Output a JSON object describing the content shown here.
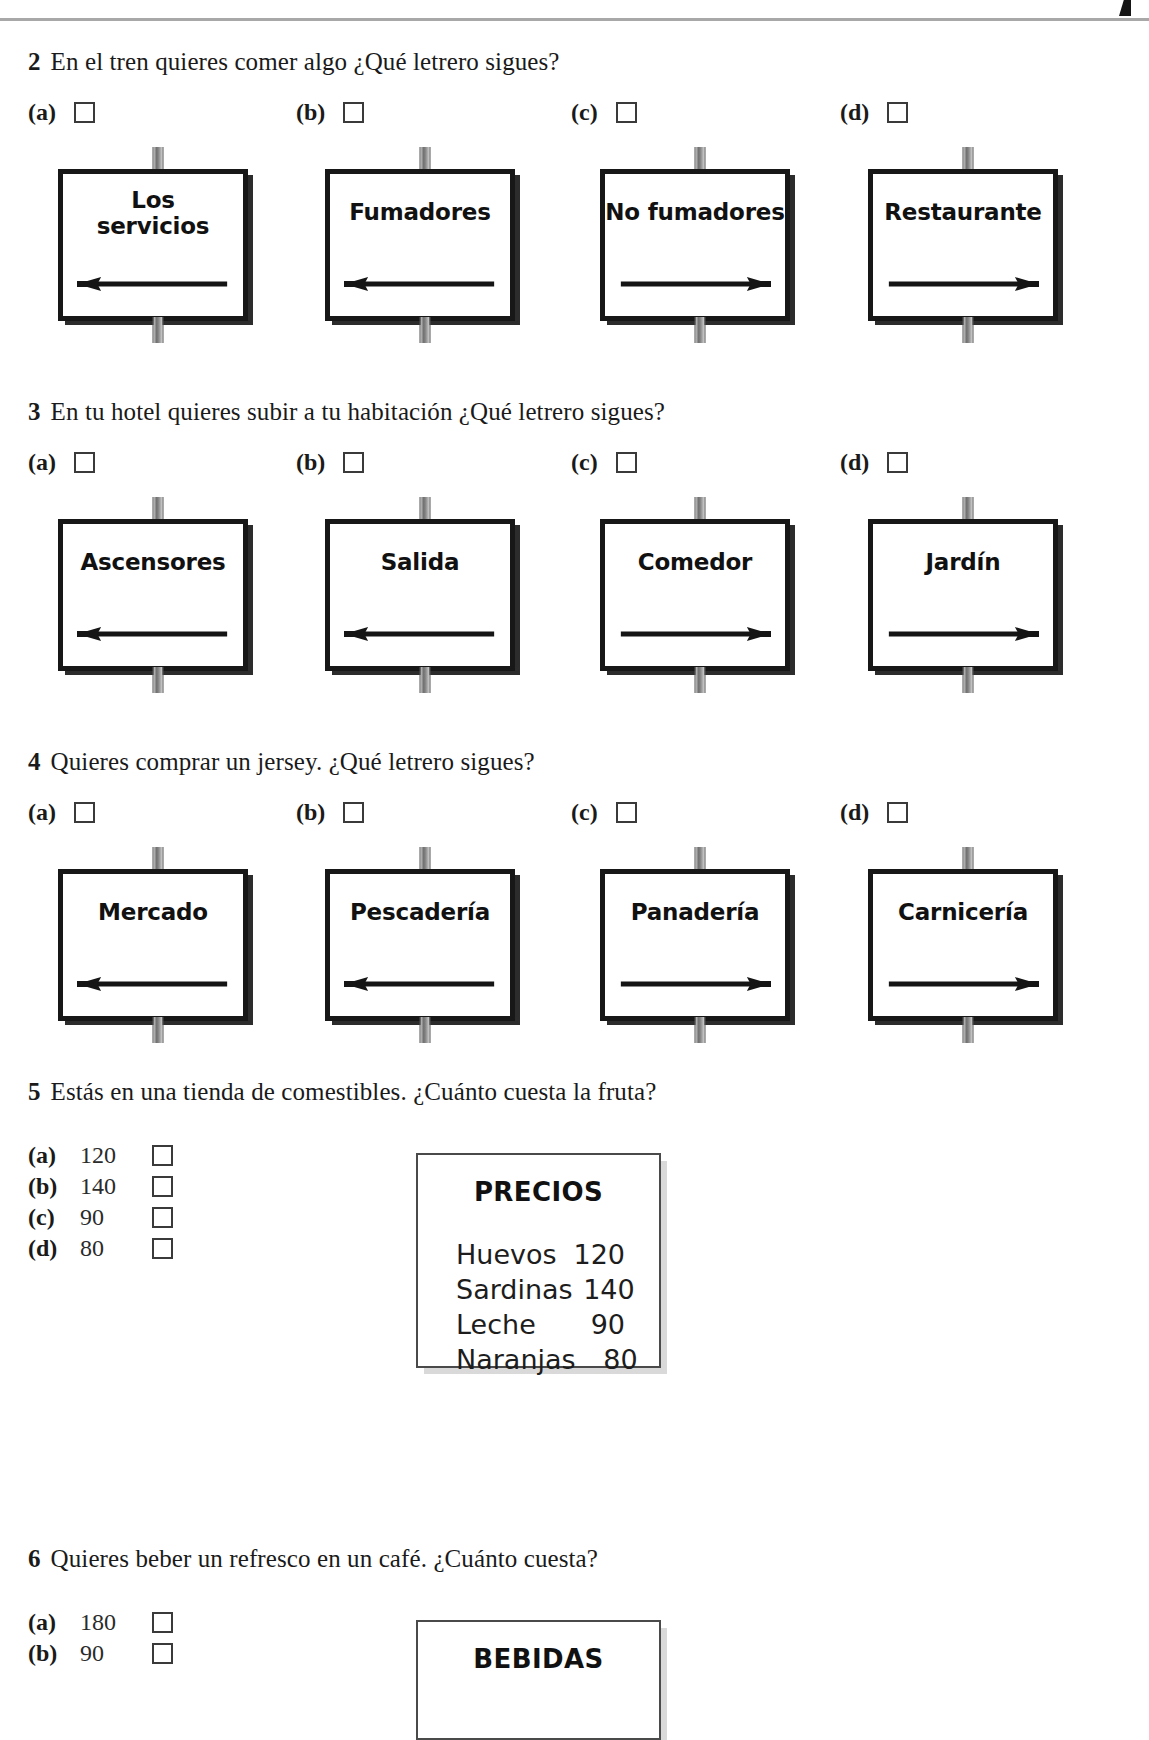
{
  "page": {
    "rule_color": "#a8a8a8"
  },
  "questions": [
    {
      "number": "2",
      "text": "En el tren quieres comer algo ¿Qué letrero sigues?",
      "options": [
        {
          "letter": "(a)",
          "sign": "Los servicios",
          "arrow": "left"
        },
        {
          "letter": "(b)",
          "sign": "Fumadores",
          "arrow": "left"
        },
        {
          "letter": "(c)",
          "sign": "No fumadores",
          "arrow": "right"
        },
        {
          "letter": "(d)",
          "sign": "Restaurante",
          "arrow": "right"
        }
      ]
    },
    {
      "number": "3",
      "text": "En tu hotel quieres subir a tu habitación ¿Qué letrero sigues?",
      "options": [
        {
          "letter": "(a)",
          "sign": "Ascensores",
          "arrow": "left"
        },
        {
          "letter": "(b)",
          "sign": "Salida",
          "arrow": "left"
        },
        {
          "letter": "(c)",
          "sign": "Comedor",
          "arrow": "right"
        },
        {
          "letter": "(d)",
          "sign": "Jardín",
          "arrow": "right"
        }
      ]
    },
    {
      "number": "4",
      "text": "Quieres comprar un jersey. ¿Qué letrero sigues?",
      "options": [
        {
          "letter": "(a)",
          "sign": "Mercado",
          "arrow": "left"
        },
        {
          "letter": "(b)",
          "sign": "Pescadería",
          "arrow": "left"
        },
        {
          "letter": "(c)",
          "sign": "Panadería",
          "arrow": "right"
        },
        {
          "letter": "(d)",
          "sign": "Carnicería",
          "arrow": "right"
        }
      ]
    },
    {
      "number": "5",
      "text": "Estás en una tienda de comestibles. ¿Cuánto cuesta la fruta?",
      "options": [
        {
          "letter": "(a)",
          "value": "120"
        },
        {
          "letter": "(b)",
          "value": "140"
        },
        {
          "letter": "(c)",
          "value": "90"
        },
        {
          "letter": "(d)",
          "value": "80"
        }
      ],
      "panel": {
        "title": "PRECIOS",
        "rows": [
          {
            "name": "Huevos",
            "price": "120"
          },
          {
            "name": "Sardinas",
            "price": "140"
          },
          {
            "name": "Leche",
            "price": "90"
          },
          {
            "name": "Naranjas",
            "price": "80"
          }
        ]
      }
    },
    {
      "number": "6",
      "text": "Quieres beber un refresco en un café. ¿Cuánto cuesta?",
      "options": [
        {
          "letter": "(a)",
          "value": "180"
        },
        {
          "letter": "(b)",
          "value": "90"
        }
      ],
      "panel": {
        "title": "BEBIDAS",
        "rows": []
      }
    }
  ]
}
